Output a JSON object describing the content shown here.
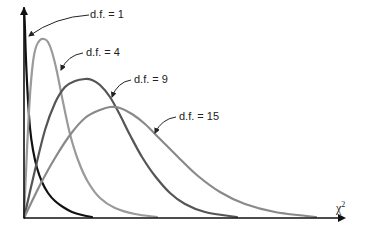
{
  "chart_data": {
    "type": "line",
    "title": "",
    "xlabel": "χ²",
    "ylabel": "",
    "grid": false,
    "legend": "inline annotations",
    "series": [
      {
        "name": "d.f. = 1",
        "df": 1,
        "color": "#111111",
        "label": "d.f. = 1",
        "points": [
          [
            24,
            8
          ],
          [
            25,
            30
          ],
          [
            26,
            60
          ],
          [
            28,
            100
          ],
          [
            30,
            128
          ],
          [
            33,
            150
          ],
          [
            37,
            168
          ],
          [
            42,
            182
          ],
          [
            48,
            193
          ],
          [
            55,
            201
          ],
          [
            63,
            207
          ],
          [
            72,
            212
          ],
          [
            82,
            215
          ],
          [
            92,
            217
          ]
        ],
        "label_pos": [
          90,
          18
        ],
        "arrow": {
          "from": [
            89,
            15
          ],
          "to": [
            29,
            36
          ]
        }
      },
      {
        "name": "d.f. = 4",
        "df": 4,
        "color": "#9a9a9a",
        "label": "d.f. = 4",
        "points": [
          [
            24,
            218
          ],
          [
            27,
            150
          ],
          [
            30,
            95
          ],
          [
            33,
            62
          ],
          [
            36,
            47
          ],
          [
            40,
            40
          ],
          [
            44,
            39
          ],
          [
            48,
            42
          ],
          [
            52,
            52
          ],
          [
            57,
            72
          ],
          [
            63,
            102
          ],
          [
            70,
            134
          ],
          [
            78,
            160
          ],
          [
            88,
            182
          ],
          [
            100,
            198
          ],
          [
            115,
            208
          ],
          [
            135,
            214
          ],
          [
            157,
            217
          ]
        ],
        "label_pos": [
          86,
          56
        ],
        "arrow": {
          "from": [
            83,
            53
          ],
          "to": [
            61,
            70
          ]
        }
      },
      {
        "name": "d.f. = 9",
        "df": 9,
        "color": "#555555",
        "label": "d.f. = 9",
        "points": [
          [
            24,
            218
          ],
          [
            35,
            170
          ],
          [
            45,
            130
          ],
          [
            55,
            103
          ],
          [
            65,
            87
          ],
          [
            75,
            81
          ],
          [
            85,
            79
          ],
          [
            92,
            80
          ],
          [
            100,
            85
          ],
          [
            110,
            97
          ],
          [
            120,
            115
          ],
          [
            130,
            135
          ],
          [
            142,
            157
          ],
          [
            155,
            176
          ],
          [
            170,
            193
          ],
          [
            185,
            204
          ],
          [
            205,
            212
          ],
          [
            237,
            217
          ]
        ],
        "label_pos": [
          134,
          83
        ],
        "arrow": {
          "from": [
            131,
            80
          ],
          "to": [
            112,
            97
          ]
        }
      },
      {
        "name": "d.f. = 15",
        "df": 15,
        "color": "#8a8a8a",
        "label": "d.f. = 15",
        "points": [
          [
            24,
            218
          ],
          [
            40,
            185
          ],
          [
            55,
            158
          ],
          [
            70,
            135
          ],
          [
            85,
            118
          ],
          [
            100,
            110
          ],
          [
            110,
            107
          ],
          [
            120,
            108
          ],
          [
            132,
            114
          ],
          [
            145,
            124
          ],
          [
            160,
            139
          ],
          [
            178,
            157
          ],
          [
            198,
            176
          ],
          [
            220,
            192
          ],
          [
            245,
            204
          ],
          [
            275,
            212
          ],
          [
            316,
            217
          ]
        ],
        "label_pos": [
          179,
          120
        ],
        "arrow": {
          "from": [
            176,
            117
          ],
          "to": [
            155,
            133
          ]
        }
      }
    ],
    "axes": {
      "origin": [
        24,
        218
      ],
      "x_end": 346,
      "y_top": 7
    }
  },
  "labels": {
    "df1": "d.f. = 1",
    "df4": "d.f. = 4",
    "df9": "d.f. = 9",
    "df15": "d.f. = 15",
    "x_axis": "χ",
    "x_axis_sup": "2"
  }
}
